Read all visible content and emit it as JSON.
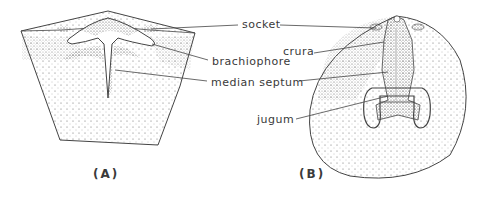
{
  "figure": {
    "panels": [
      {
        "id": "A",
        "caption": "(A)",
        "description": "brachiopod valve interior, oblique view"
      },
      {
        "id": "B",
        "caption": "(B)",
        "description": "brachiopod valve interior, plan view"
      }
    ],
    "labels": {
      "socket": "socket",
      "brachiophore": "brachiophore",
      "median_septum": "median septum",
      "crura": "crura",
      "jugum": "jugum"
    },
    "colors": {
      "line": "#444444",
      "stipple": "#555555",
      "background": "#ffffff"
    }
  }
}
